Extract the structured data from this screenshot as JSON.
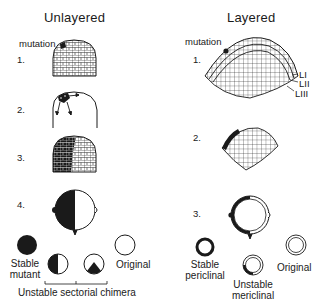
{
  "unlayered": {
    "heading": "Unlayered",
    "mutation_label": "mutation",
    "steps": [
      "1.",
      "2.",
      "3.",
      "4."
    ],
    "outcomes": {
      "stable_mutant": [
        "Stable",
        "mutant"
      ],
      "original": "Original",
      "bracket_caption": "Unstable sectorial chimera"
    }
  },
  "layered": {
    "heading": "Layered",
    "mutation_label": "mutation",
    "steps": [
      "1.",
      "2.",
      "3."
    ],
    "layer_labels": [
      "LI",
      "LII",
      "LIII"
    ],
    "outcomes": {
      "stable_periclinal": [
        "Stable",
        "periclinal"
      ],
      "unstable_mericlinal": [
        "Unstable",
        "mericlinal"
      ],
      "original": "Original"
    }
  },
  "colors": {
    "ink": "#1a1a1a",
    "background": "#ffffff"
  }
}
